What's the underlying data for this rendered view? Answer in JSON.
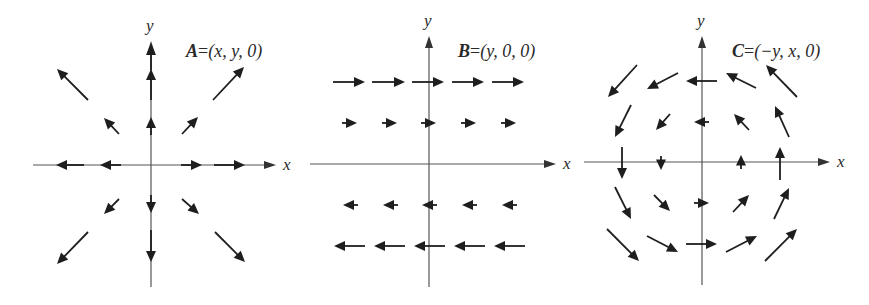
{
  "figure": {
    "panels": [
      {
        "id": "A",
        "title_name": "A",
        "title_eq": "=",
        "title_rhs": "(x, y, 0)",
        "x_axis_label": "x",
        "y_axis_label": "y",
        "origin": [
          151,
          165
        ],
        "x_axis": [
          33,
          268
        ],
        "y_axis": [
          45,
          287
        ],
        "label_pos": [
          186,
          57
        ],
        "arrows": [
          {
            "x1": 151,
            "y1": 70,
            "x2": 151,
            "y2": 44
          },
          {
            "x1": 151,
            "y1": 100,
            "x2": 151,
            "y2": 69
          },
          {
            "x1": 151,
            "y1": 135,
            "x2": 151,
            "y2": 117
          },
          {
            "x1": 151,
            "y1": 195,
            "x2": 151,
            "y2": 213
          },
          {
            "x1": 151,
            "y1": 230,
            "x2": 151,
            "y2": 262
          },
          {
            "x1": 121,
            "y1": 165,
            "x2": 100,
            "y2": 165
          },
          {
            "x1": 84,
            "y1": 165,
            "x2": 56,
            "y2": 165
          },
          {
            "x1": 181,
            "y1": 165,
            "x2": 202,
            "y2": 165
          },
          {
            "x1": 214,
            "y1": 165,
            "x2": 245,
            "y2": 165
          },
          {
            "x1": 119,
            "y1": 134,
            "x2": 104,
            "y2": 118
          },
          {
            "x1": 88,
            "y1": 100,
            "x2": 57,
            "y2": 69
          },
          {
            "x1": 182,
            "y1": 134,
            "x2": 198,
            "y2": 117
          },
          {
            "x1": 213,
            "y1": 100,
            "x2": 244,
            "y2": 67
          },
          {
            "x1": 119,
            "y1": 199,
            "x2": 104,
            "y2": 214
          },
          {
            "x1": 88,
            "y1": 232,
            "x2": 57,
            "y2": 264
          },
          {
            "x1": 182,
            "y1": 199,
            "x2": 199,
            "y2": 214
          },
          {
            "x1": 215,
            "y1": 232,
            "x2": 245,
            "y2": 262
          }
        ]
      },
      {
        "id": "B",
        "title_name": "B",
        "title_eq": "=",
        "title_rhs": "(y, 0, 0)",
        "x_axis_label": "x",
        "y_axis_label": "y",
        "origin": [
          429,
          164
        ],
        "x_axis": [
          310,
          548
        ],
        "y_axis": [
          40,
          287
        ],
        "label_pos": [
          458,
          57
        ],
        "arrows": [
          {
            "x1": 333,
            "y1": 82,
            "x2": 365,
            "y2": 82
          },
          {
            "x1": 372,
            "y1": 82,
            "x2": 405,
            "y2": 82
          },
          {
            "x1": 412,
            "y1": 82,
            "x2": 444,
            "y2": 82
          },
          {
            "x1": 452,
            "y1": 82,
            "x2": 484,
            "y2": 82
          },
          {
            "x1": 492,
            "y1": 82,
            "x2": 524,
            "y2": 82
          },
          {
            "x1": 342,
            "y1": 123,
            "x2": 357,
            "y2": 123
          },
          {
            "x1": 382,
            "y1": 123,
            "x2": 397,
            "y2": 123
          },
          {
            "x1": 421,
            "y1": 123,
            "x2": 436,
            "y2": 123
          },
          {
            "x1": 461,
            "y1": 123,
            "x2": 476,
            "y2": 123
          },
          {
            "x1": 501,
            "y1": 123,
            "x2": 516,
            "y2": 123
          },
          {
            "x1": 358,
            "y1": 205,
            "x2": 343,
            "y2": 205
          },
          {
            "x1": 398,
            "y1": 205,
            "x2": 383,
            "y2": 205
          },
          {
            "x1": 437,
            "y1": 205,
            "x2": 422,
            "y2": 205
          },
          {
            "x1": 477,
            "y1": 205,
            "x2": 462,
            "y2": 205
          },
          {
            "x1": 517,
            "y1": 205,
            "x2": 502,
            "y2": 205
          },
          {
            "x1": 365,
            "y1": 246,
            "x2": 334,
            "y2": 246
          },
          {
            "x1": 405,
            "y1": 246,
            "x2": 374,
            "y2": 246
          },
          {
            "x1": 445,
            "y1": 246,
            "x2": 414,
            "y2": 246
          },
          {
            "x1": 485,
            "y1": 246,
            "x2": 454,
            "y2": 246
          },
          {
            "x1": 525,
            "y1": 246,
            "x2": 494,
            "y2": 246
          }
        ]
      },
      {
        "id": "C",
        "title_name": "C",
        "title_eq": "=",
        "title_rhs": "(−y, x, 0)",
        "x_axis_label": "x",
        "y_axis_label": "y",
        "origin": [
          702,
          162
        ],
        "x_axis": [
          584,
          822
        ],
        "y_axis": [
          40,
          285
        ],
        "label_pos": [
          732,
          57
        ],
        "arrows": [
          {
            "x1": 637,
            "y1": 65,
            "x2": 608,
            "y2": 97
          },
          {
            "x1": 678,
            "y1": 73,
            "x2": 647,
            "y2": 89
          },
          {
            "x1": 717,
            "y1": 81,
            "x2": 686,
            "y2": 81
          },
          {
            "x1": 756,
            "y1": 88,
            "x2": 726,
            "y2": 73
          },
          {
            "x1": 797,
            "y1": 97,
            "x2": 766,
            "y2": 65
          },
          {
            "x1": 631,
            "y1": 105,
            "x2": 615,
            "y2": 137
          },
          {
            "x1": 670,
            "y1": 114,
            "x2": 656,
            "y2": 130
          },
          {
            "x1": 709,
            "y1": 122,
            "x2": 694,
            "y2": 122
          },
          {
            "x1": 749,
            "y1": 130,
            "x2": 734,
            "y2": 114
          },
          {
            "x1": 789,
            "y1": 137,
            "x2": 775,
            "y2": 106
          },
          {
            "x1": 622,
            "y1": 147,
            "x2": 622,
            "y2": 179
          },
          {
            "x1": 661,
            "y1": 156,
            "x2": 661,
            "y2": 170
          },
          {
            "x1": 741,
            "y1": 169,
            "x2": 741,
            "y2": 155
          },
          {
            "x1": 780,
            "y1": 180,
            "x2": 780,
            "y2": 147
          },
          {
            "x1": 615,
            "y1": 187,
            "x2": 631,
            "y2": 219
          },
          {
            "x1": 654,
            "y1": 195,
            "x2": 670,
            "y2": 211
          },
          {
            "x1": 694,
            "y1": 203,
            "x2": 709,
            "y2": 203
          },
          {
            "x1": 733,
            "y1": 212,
            "x2": 749,
            "y2": 195
          },
          {
            "x1": 774,
            "y1": 219,
            "x2": 789,
            "y2": 188
          },
          {
            "x1": 607,
            "y1": 229,
            "x2": 639,
            "y2": 261
          },
          {
            "x1": 647,
            "y1": 236,
            "x2": 678,
            "y2": 252
          },
          {
            "x1": 686,
            "y1": 244,
            "x2": 717,
            "y2": 244
          },
          {
            "x1": 726,
            "y1": 252,
            "x2": 757,
            "y2": 236
          },
          {
            "x1": 765,
            "y1": 261,
            "x2": 797,
            "y2": 229
          }
        ]
      }
    ]
  }
}
